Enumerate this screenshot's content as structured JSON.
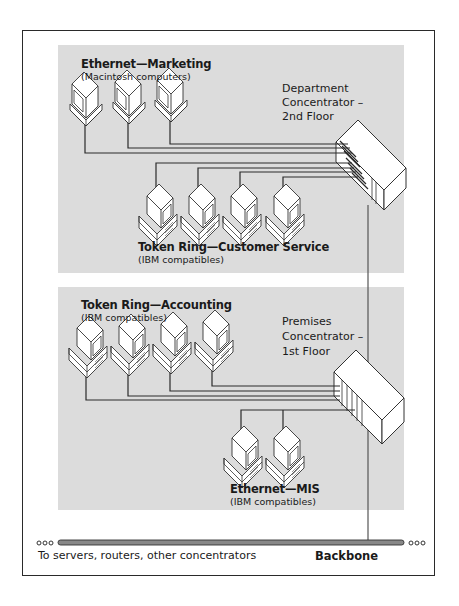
{
  "diagram": {
    "type": "network-topology",
    "groups": [
      {
        "id": "marketing",
        "title": "Ethernet—Marketing",
        "subtitle": "(Macintosh computers)",
        "computer_type": "macintosh",
        "count": 3,
        "connects_to": "department-concentrator"
      },
      {
        "id": "customer-service",
        "title": "Token Ring—Customer Service",
        "subtitle": "(IBM compatibles)",
        "computer_type": "ibm-compatible",
        "count": 4,
        "connects_to": "department-concentrator"
      },
      {
        "id": "accounting",
        "title": "Token Ring—Accounting",
        "subtitle": "(IBM compatibles)",
        "computer_type": "ibm-compatible",
        "count": 4,
        "connects_to": "premises-concentrator"
      },
      {
        "id": "mis",
        "title": "Ethernet—MIS",
        "subtitle": "(IBM compatibles)",
        "computer_type": "ibm-compatible",
        "count": 2,
        "connects_to": "premises-concentrator"
      }
    ],
    "concentrators": [
      {
        "id": "department-concentrator",
        "label_lines": [
          "Department",
          "Concentrator –",
          "2nd Floor"
        ],
        "connects_to": "backbone"
      },
      {
        "id": "premises-concentrator",
        "label_lines": [
          "Premises",
          "Concentrator –",
          "1st Floor"
        ],
        "connects_to": "backbone"
      }
    ],
    "backbone": {
      "label": "Backbone",
      "caption": "To servers, routers, other concentrators"
    },
    "colors": {
      "panel": "#dcdcdc",
      "line": "#2a2a2a",
      "device_fill": "#ffffff"
    }
  }
}
